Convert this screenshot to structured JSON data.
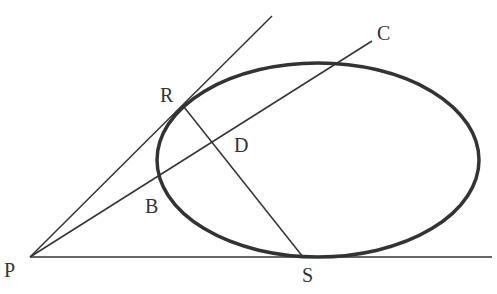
{
  "diagram": {
    "labels": {
      "P": "P",
      "R": "R",
      "C": "C",
      "D": "D",
      "B": "B",
      "S": "S"
    },
    "colors": {
      "stroke": "#333333",
      "background": "#ffffff"
    }
  }
}
